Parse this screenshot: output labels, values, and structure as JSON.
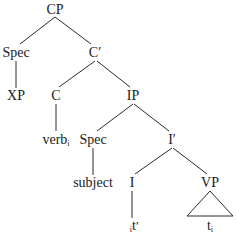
{
  "diagram": {
    "type": "syntax-tree",
    "nodes": [
      {
        "id": "cp",
        "label": "CP",
        "x": 55,
        "y": 10
      },
      {
        "id": "spec-cp",
        "label": "Spec",
        "x": 16,
        "y": 53
      },
      {
        "id": "xp",
        "label": "XP",
        "x": 16,
        "y": 96
      },
      {
        "id": "c-bar",
        "label": "C′",
        "x": 95,
        "y": 53
      },
      {
        "id": "c",
        "label": "C",
        "x": 56,
        "y": 96
      },
      {
        "id": "verb",
        "label": "verb",
        "sub": "i",
        "x": 56,
        "y": 140
      },
      {
        "id": "ip",
        "label": "IP",
        "x": 133,
        "y": 96
      },
      {
        "id": "spec-ip",
        "label": "Spec",
        "x": 93,
        "y": 140
      },
      {
        "id": "subject",
        "label": "subject",
        "x": 93,
        "y": 183
      },
      {
        "id": "i-bar",
        "label": "I′",
        "x": 172,
        "y": 140
      },
      {
        "id": "i",
        "label": "I",
        "x": 132,
        "y": 183
      },
      {
        "id": "t-prime",
        "label": "t",
        "sub": "i",
        "prime": "′",
        "x": 132,
        "y": 226
      },
      {
        "id": "vp",
        "label": "VP",
        "x": 210,
        "y": 183
      },
      {
        "id": "t",
        "label": "t",
        "sub": "i",
        "x": 210,
        "y": 226
      }
    ],
    "edges": [
      {
        "from": "cp",
        "to": "spec-cp",
        "x1": 55,
        "y1": 17,
        "x2": 20,
        "y2": 44
      },
      {
        "from": "cp",
        "to": "c-bar",
        "x1": 55,
        "y1": 17,
        "x2": 91,
        "y2": 44
      },
      {
        "from": "spec-cp",
        "to": "xp",
        "x1": 16,
        "y1": 61,
        "x2": 16,
        "y2": 88
      },
      {
        "from": "c-bar",
        "to": "c",
        "x1": 95,
        "y1": 61,
        "x2": 59,
        "y2": 87
      },
      {
        "from": "c-bar",
        "to": "ip",
        "x1": 97,
        "y1": 61,
        "x2": 130,
        "y2": 87
      },
      {
        "from": "c",
        "to": "verb",
        "x1": 56,
        "y1": 104,
        "x2": 56,
        "y2": 131
      },
      {
        "from": "ip",
        "to": "spec-ip",
        "x1": 133,
        "y1": 104,
        "x2": 97,
        "y2": 131
      },
      {
        "from": "ip",
        "to": "i-bar",
        "x1": 134,
        "y1": 104,
        "x2": 169,
        "y2": 131
      },
      {
        "from": "spec-ip",
        "to": "subject",
        "x1": 93,
        "y1": 148,
        "x2": 93,
        "y2": 175
      },
      {
        "from": "i-bar",
        "to": "i",
        "x1": 172,
        "y1": 148,
        "x2": 135,
        "y2": 174
      },
      {
        "from": "i-bar",
        "to": "vp",
        "x1": 173,
        "y1": 148,
        "x2": 207,
        "y2": 174
      },
      {
        "from": "i",
        "to": "t-prime",
        "x1": 132,
        "y1": 191,
        "x2": 132,
        "y2": 218
      }
    ],
    "triangle": {
      "under": "vp",
      "points": "210,191 187,216 233,216"
    }
  }
}
